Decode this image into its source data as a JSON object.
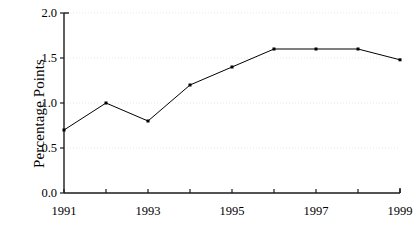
{
  "chart_data": {
    "type": "line",
    "title": "",
    "subtitle": "",
    "xlabel": "",
    "ylabel": "Percentage Points",
    "x": [
      1991,
      1992,
      1993,
      1994,
      1995,
      1996,
      1997,
      1998,
      1999
    ],
    "values": [
      0.7,
      1.0,
      0.8,
      1.2,
      1.4,
      1.6,
      1.6,
      1.6,
      1.48
    ],
    "series": [
      {
        "name": "Percentage Points",
        "values": [
          0.7,
          1.0,
          0.8,
          1.2,
          1.4,
          1.6,
          1.6,
          1.6,
          1.48
        ]
      }
    ],
    "xlim": [
      1991,
      1999
    ],
    "ylim": [
      0.0,
      2.0
    ],
    "y_ticks": [
      0.0,
      0.5,
      1.0,
      1.5,
      2.0
    ],
    "y_tick_labels": [
      "0.0",
      "0.5",
      "1.0",
      "1.5",
      "2.0"
    ],
    "x_ticks": [
      1991,
      1992,
      1993,
      1994,
      1995,
      1996,
      1997,
      1998,
      1999
    ],
    "x_tick_labels": [
      "1991",
      "",
      "1993",
      "",
      "1995",
      "",
      "1997",
      "",
      "1999"
    ],
    "x_labeled_ticks": [
      {
        "value": 1991,
        "label": "1991"
      },
      {
        "value": 1993,
        "label": "1993"
      },
      {
        "value": 1995,
        "label": "1995"
      },
      {
        "value": 1997,
        "label": "1997"
      },
      {
        "value": 1999,
        "label": "1999"
      }
    ],
    "grid": {
      "horizontal": true,
      "vertical": false,
      "style": "dotted",
      "color": "#e8e8e8"
    },
    "legend": {
      "visible": false,
      "position": "none",
      "entries": []
    },
    "marker": {
      "shape": "square",
      "size": 3,
      "color": "#000000"
    },
    "line": {
      "color": "#000000",
      "width": 1
    },
    "axis_color": "#1a1a1a"
  },
  "plot_geometry": {
    "left": 64,
    "right": 400,
    "top": 13,
    "bottom": 193
  }
}
